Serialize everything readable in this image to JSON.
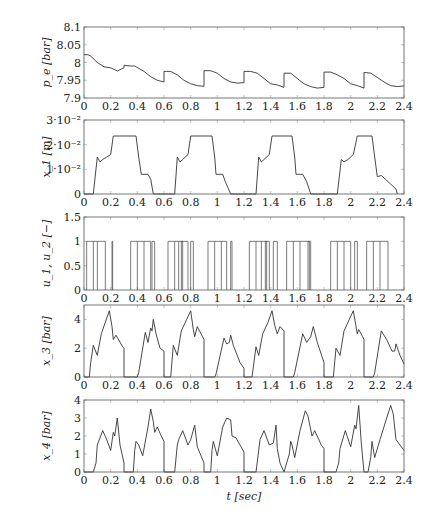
{
  "figure": {
    "xlabel": "t [sec]"
  },
  "chart_data": [
    {
      "type": "line",
      "ylabel": "p_e [bar]",
      "xlabel": "",
      "xlim": [
        0,
        2.4
      ],
      "ylim": [
        7.9,
        8.1
      ],
      "xticks": [
        0,
        0.2,
        0.4,
        0.6,
        0.8,
        1,
        1.2,
        1.4,
        1.6,
        1.8,
        2,
        2.2,
        2.4
      ],
      "yticks": [
        7.9,
        7.95,
        8,
        8.05,
        8.1
      ],
      "ytick_labels": [
        "7.9",
        "7.95",
        "8",
        "8.05",
        "8.1"
      ],
      "series": [
        {
          "name": "p_e",
          "x": [
            0,
            0.03,
            0.05,
            0.1,
            0.15,
            0.2,
            0.25,
            0.27,
            0.3,
            0.3,
            0.35,
            0.38,
            0.45,
            0.5,
            0.55,
            0.6,
            0.6,
            0.62,
            0.65,
            0.7,
            0.75,
            0.8,
            0.85,
            0.9,
            0.9,
            0.95,
            1.0,
            1.05,
            1.1,
            1.15,
            1.2,
            1.2,
            1.25,
            1.3,
            1.35,
            1.4,
            1.45,
            1.5,
            1.5,
            1.55,
            1.6,
            1.65,
            1.7,
            1.75,
            1.8,
            1.8,
            1.85,
            1.9,
            1.95,
            2.0,
            2.05,
            2.1,
            2.1,
            2.15,
            2.2,
            2.25,
            2.3,
            2.35,
            2.4
          ],
          "y": [
            8.022,
            8.022,
            8.018,
            8.0,
            7.988,
            7.985,
            7.976,
            7.98,
            7.985,
            7.992,
            7.99,
            7.99,
            7.975,
            7.96,
            7.95,
            7.945,
            7.975,
            7.975,
            7.975,
            7.965,
            7.95,
            7.94,
            7.935,
            7.933,
            7.977,
            7.977,
            7.97,
            7.955,
            7.945,
            7.942,
            7.943,
            7.975,
            7.975,
            7.97,
            7.955,
            7.94,
            7.937,
            7.93,
            7.97,
            7.97,
            7.955,
            7.94,
            7.932,
            7.928,
            7.93,
            7.973,
            7.973,
            7.965,
            7.955,
            7.94,
            7.935,
            7.928,
            7.972,
            7.97,
            7.958,
            7.945,
            7.935,
            7.932,
            7.934
          ]
        }
      ]
    },
    {
      "type": "line",
      "ylabel": "x_1 [m]",
      "xlabel": "",
      "xlim": [
        0,
        2.4
      ],
      "ylim": [
        0,
        0.03
      ],
      "xticks": [
        0,
        0.2,
        0.4,
        0.6,
        0.8,
        1,
        1.2,
        1.4,
        1.6,
        1.8,
        2,
        2.2,
        2.4
      ],
      "yticks": [
        0,
        0.01,
        0.02,
        0.03
      ],
      "ytick_labels": [
        "0",
        "1·10⁻²",
        "2·10⁻²",
        "3·10⁻²"
      ],
      "series": [
        {
          "name": "x_1",
          "x": [
            0,
            0.07,
            0.1,
            0.12,
            0.14,
            0.17,
            0.2,
            0.22,
            0.39,
            0.41,
            0.43,
            0.48,
            0.5,
            0.52,
            0.68,
            0.7,
            0.72,
            0.74,
            0.78,
            0.8,
            0.82,
            0.96,
            0.98,
            0.99,
            1.04,
            1.06,
            1.1,
            1.29,
            1.31,
            1.33,
            1.35,
            1.39,
            1.41,
            1.44,
            1.56,
            1.58,
            1.59,
            1.64,
            1.67,
            1.7,
            1.9,
            1.93,
            1.95,
            1.98,
            2.02,
            2.05,
            2.16,
            2.18,
            2.2,
            2.23,
            2.26,
            2.3,
            2.34,
            2.35
          ],
          "y": [
            0,
            0,
            0.015,
            0.013,
            0.014,
            0.015,
            0.016,
            0.0235,
            0.0235,
            0.015,
            0.008,
            0.008,
            0.006,
            0,
            0,
            0.015,
            0.013,
            0.014,
            0.016,
            0.0235,
            0.0235,
            0.0235,
            0.015,
            0.008,
            0.008,
            0.005,
            0,
            0,
            0.015,
            0.013,
            0.014,
            0.016,
            0.0235,
            0.0235,
            0.0235,
            0.015,
            0.008,
            0.008,
            0.005,
            0,
            0,
            0.014,
            0.013,
            0.014,
            0.016,
            0.0235,
            0.0235,
            0.015,
            0.007,
            0.0075,
            0.006,
            0.004,
            0.002,
            0
          ]
        }
      ]
    },
    {
      "type": "line",
      "ylabel": "u_1, u_2 [−]",
      "xlabel": "",
      "xlim": [
        0,
        2.4
      ],
      "ylim": [
        0,
        1.5
      ],
      "xticks": [
        0,
        0.2,
        0.4,
        0.6,
        0.8,
        1,
        1.2,
        1.4,
        1.6,
        1.8,
        2,
        2.2,
        2.4
      ],
      "yticks": [
        0,
        0.5,
        1,
        1.5
      ],
      "ytick_labels": [
        "0",
        "0.5",
        "1",
        "1.5"
      ],
      "pulse_value": 1,
      "series": [
        {
          "name": "u_1, u_2 pulses (on intervals)",
          "intervals": [
            [
              0.02,
              0.16
            ],
            [
              0.21,
              0.215
            ],
            [
              0.35,
              0.5
            ],
            [
              0.51,
              0.53
            ],
            [
              0.63,
              0.78
            ],
            [
              0.73,
              0.74
            ],
            [
              0.8,
              0.82
            ],
            [
              0.93,
              1.07
            ],
            [
              1.1,
              1.11
            ],
            [
              1.24,
              1.39
            ],
            [
              1.36,
              1.37
            ],
            [
              1.42,
              1.45
            ],
            [
              1.52,
              1.69
            ],
            [
              1.68,
              1.7
            ],
            [
              1.85,
              2.0
            ],
            [
              2.03,
              2.05
            ],
            [
              2.12,
              2.28
            ]
          ],
          "inner_edges": [
            0.07,
            0.1,
            0.4,
            0.45,
            0.68,
            0.71,
            0.98,
            1.03,
            1.29,
            1.33,
            1.57,
            1.62,
            1.9,
            1.95,
            2.17,
            2.22
          ]
        }
      ]
    },
    {
      "type": "line",
      "ylabel": "x_3 [bar]",
      "xlabel": "",
      "xlim": [
        0,
        2.4
      ],
      "ylim": [
        0,
        5
      ],
      "xticks": [
        0,
        0.2,
        0.4,
        0.6,
        0.8,
        1,
        1.2,
        1.4,
        1.6,
        1.8,
        2,
        2.2,
        2.4
      ],
      "yticks": [
        0,
        2,
        4
      ],
      "ytick_labels": [
        "0",
        "2",
        "4"
      ],
      "series": [
        {
          "name": "x_3",
          "x": [
            0,
            0.04,
            0.05,
            0.07,
            0.1,
            0.13,
            0.16,
            0.19,
            0.21,
            0.22,
            0.24,
            0.29,
            0.3,
            0.3,
            0.4,
            0.41,
            0.46,
            0.48,
            0.5,
            0.51,
            0.52,
            0.54,
            0.57,
            0.6,
            0.6,
            0.65,
            0.67,
            0.7,
            0.73,
            0.77,
            0.8,
            0.82,
            0.83,
            0.85,
            0.9,
            0.9,
            0.98,
            0.99,
            1.05,
            1.07,
            1.09,
            1.1,
            1.12,
            1.17,
            1.2,
            1.2,
            1.26,
            1.29,
            1.31,
            1.34,
            1.38,
            1.41,
            1.43,
            1.45,
            1.47,
            1.5,
            1.5,
            1.57,
            1.58,
            1.64,
            1.67,
            1.7,
            1.72,
            1.75,
            1.8,
            1.8,
            1.87,
            1.89,
            1.92,
            1.95,
            1.99,
            2.02,
            2.05,
            2.06,
            2.09,
            2.1,
            2.1,
            2.17,
            2.18,
            2.23,
            2.27,
            2.31,
            2.33,
            2.34,
            2.37,
            2.4
          ],
          "y": [
            0,
            0,
            1.0,
            2.2,
            1.5,
            3.0,
            3.8,
            4.6,
            3.5,
            2.6,
            2.9,
            2.1,
            2.0,
            0,
            0,
            0.3,
            3.1,
            2.4,
            3.4,
            3.2,
            4.0,
            3.0,
            2.0,
            1.8,
            0,
            0,
            2.2,
            1.5,
            3.2,
            4.0,
            4.6,
            3.3,
            2.8,
            3.5,
            2.6,
            0,
            0,
            0.2,
            2.7,
            2.3,
            2.4,
            2.9,
            2.2,
            1.0,
            0.6,
            0,
            0,
            2.1,
            1.5,
            3.0,
            3.8,
            4.6,
            3.6,
            3.0,
            3.5,
            3.2,
            0,
            0,
            0.3,
            3.0,
            2.4,
            2.8,
            3.5,
            2.4,
            1.0,
            0,
            0,
            2.0,
            1.5,
            3.2,
            4.0,
            4.6,
            3.0,
            3.3,
            2.8,
            2.6,
            0,
            0,
            0.3,
            3.2,
            2.6,
            1.8,
            1.8,
            2.3,
            1.5,
            0.9
          ]
        }
      ]
    },
    {
      "type": "line",
      "ylabel": "x_4 [bar]",
      "xlabel": "t [sec]",
      "xlim": [
        0,
        2.4
      ],
      "ylim": [
        0,
        4
      ],
      "xticks": [
        0,
        0.2,
        0.4,
        0.6,
        0.8,
        1,
        1.2,
        1.4,
        1.6,
        1.8,
        2,
        2.2,
        2.4
      ],
      "yticks": [
        0,
        1,
        2,
        3,
        4
      ],
      "ytick_labels": [
        "0",
        "1",
        "2",
        "3",
        "4"
      ],
      "series": [
        {
          "name": "x_4",
          "x": [
            0,
            0.07,
            0.09,
            0.1,
            0.14,
            0.17,
            0.2,
            0.22,
            0.23,
            0.24,
            0.25,
            0.27,
            0.3,
            0.3,
            0.37,
            0.38,
            0.39,
            0.41,
            0.44,
            0.48,
            0.5,
            0.52,
            0.53,
            0.55,
            0.58,
            0.6,
            0.6,
            0.68,
            0.7,
            0.71,
            0.74,
            0.78,
            0.8,
            0.83,
            0.85,
            0.9,
            0.9,
            0.95,
            0.96,
            0.97,
            1.0,
            1.04,
            1.07,
            1.1,
            1.11,
            1.14,
            1.2,
            1.2,
            1.29,
            1.31,
            1.32,
            1.35,
            1.39,
            1.42,
            1.44,
            1.45,
            1.47,
            1.5,
            1.5,
            1.54,
            1.55,
            1.56,
            1.58,
            1.62,
            1.66,
            1.68,
            1.71,
            1.73,
            1.78,
            1.8,
            1.8,
            1.89,
            1.91,
            1.92,
            1.96,
            2.0,
            2.03,
            2.04,
            2.06,
            2.08,
            2.1,
            2.1,
            2.13,
            2.15,
            2.16,
            2.18,
            2.22,
            2.27,
            2.3,
            2.32,
            2.34,
            2.37,
            2.4
          ],
          "y": [
            0,
            0,
            0.5,
            1.5,
            2.3,
            1.8,
            1.2,
            2.2,
            2.0,
            2.5,
            3.0,
            1.5,
            0.5,
            0,
            0,
            1.2,
            1.7,
            1.5,
            0.9,
            2.5,
            3.5,
            2.8,
            2.2,
            2.5,
            2.0,
            1.7,
            0,
            0,
            1.5,
            1.8,
            2.3,
            1.5,
            1.8,
            2.6,
            1.4,
            0.5,
            0,
            0,
            1.2,
            1.7,
            0.9,
            2.5,
            3.0,
            2.9,
            2.0,
            1.9,
            1.1,
            0,
            0,
            1.2,
            1.8,
            2.3,
            1.5,
            1.6,
            2.6,
            1.3,
            0.5,
            0,
            0,
            1.0,
            1.7,
            1.5,
            0.8,
            2.3,
            3.4,
            3.1,
            2.0,
            2.3,
            1.5,
            1.3,
            0,
            0,
            0.5,
            1.3,
            2.3,
            1.4,
            2.6,
            2.4,
            3.7,
            1.6,
            0,
            0,
            0,
            0.8,
            1.7,
            0.8,
            1.8,
            3.0,
            3.7,
            3.2,
            1.8,
            1.5,
            1.2
          ]
        }
      ]
    }
  ]
}
